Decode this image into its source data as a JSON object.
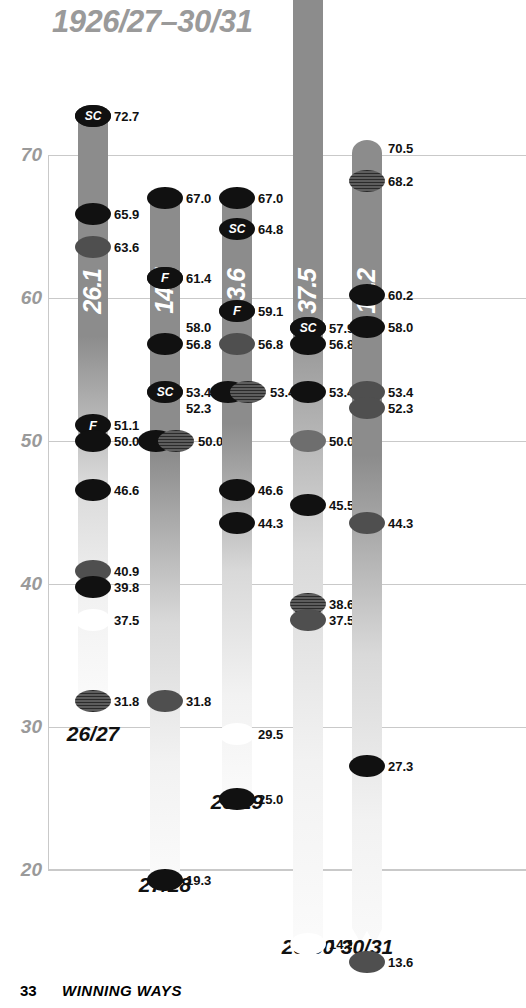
{
  "chart_data": {
    "type": "scatter",
    "title": "1926/27–30/31",
    "xlabel": "",
    "ylabel": "",
    "ylim": [
      20,
      90
    ],
    "grid": true,
    "yticks": [
      "70",
      "60",
      "50",
      "40",
      "30",
      "20"
    ],
    "legend_position": "none",
    "categories": [
      "26/27",
      "27/28",
      "28/29",
      "29/30",
      "30/31"
    ],
    "bar_values": [
      26.1,
      14.7,
      13.6,
      37.5,
      18.2
    ],
    "series": [
      {
        "name": "26/27",
        "bar_label": "26.1",
        "bar_top": 72.7,
        "bar_bottom": 31.8,
        "bar_break": false,
        "points": [
          {
            "value": "72.7",
            "badge": "SC",
            "style": "dark"
          },
          {
            "value": "65.9",
            "badge": "",
            "style": "dark"
          },
          {
            "value": "63.6",
            "badge": "",
            "style": "mid"
          },
          {
            "value": "51.1",
            "badge": "F",
            "style": "none"
          },
          {
            "value": "50.0",
            "badge": "",
            "style": "dark"
          },
          {
            "value": "46.6",
            "badge": "",
            "style": "dark"
          },
          {
            "value": "40.9",
            "badge": "",
            "style": "mid"
          },
          {
            "value": "39.8",
            "badge": "",
            "style": "dark"
          },
          {
            "value": "37.5",
            "badge": "",
            "style": "light"
          },
          {
            "value": "31.8",
            "badge": "",
            "style": "hatch"
          }
        ]
      },
      {
        "name": "27/28",
        "bar_label": "14.7",
        "bar_top": 67.0,
        "bar_bottom": 19.3,
        "bar_break": false,
        "points": [
          {
            "value": "67.0",
            "badge": "",
            "style": "dark"
          },
          {
            "value": "61.4",
            "badge": "F",
            "style": "dark"
          },
          {
            "value": "58.0",
            "badge": "",
            "style": "none"
          },
          {
            "value": "56.8",
            "badge": "",
            "style": "dark"
          },
          {
            "value": "53.4",
            "badge": "SC",
            "style": "mid"
          },
          {
            "value": "52.3",
            "badge": "",
            "style": "none"
          },
          {
            "value": "50.0",
            "badge": "",
            "style": "dark+hatch"
          },
          {
            "value": "31.8",
            "badge": "",
            "style": "mid"
          },
          {
            "value": "19.3",
            "badge": "",
            "style": "dark"
          }
        ]
      },
      {
        "name": "28/29",
        "bar_label": "13.6",
        "bar_top": 67.0,
        "bar_bottom": 25.0,
        "bar_break": false,
        "points": [
          {
            "value": "67.0",
            "badge": "",
            "style": "dark"
          },
          {
            "value": "64.8",
            "badge": "SC",
            "style": "none"
          },
          {
            "value": "59.1",
            "badge": "F",
            "style": "mid"
          },
          {
            "value": "56.8",
            "badge": "",
            "style": "mid"
          },
          {
            "value": "53.4",
            "badge": "",
            "style": "dark+hatch"
          },
          {
            "value": "46.6",
            "badge": "",
            "style": "dark"
          },
          {
            "value": "44.3",
            "badge": "",
            "style": "dark"
          },
          {
            "value": "29.5",
            "badge": "",
            "style": "light"
          },
          {
            "value": "25.0",
            "badge": "",
            "style": "dark"
          }
        ]
      },
      {
        "name": "29/30",
        "bar_label": "37.5",
        "bar_top": 87.5,
        "bar_bottom": 14.8,
        "bar_break": true,
        "points": [
          {
            "value": "87.5",
            "badge": "F",
            "style": "none"
          },
          {
            "value": "57.9",
            "badge": "SC",
            "style": "dark"
          },
          {
            "value": "56.8",
            "badge": "",
            "style": "dark"
          },
          {
            "value": "53.4",
            "badge": "",
            "style": "dark"
          },
          {
            "value": "50.0",
            "badge": "",
            "style": "gray"
          },
          {
            "value": "45.5",
            "badge": "",
            "style": "dark"
          },
          {
            "value": "38.6",
            "badge": "",
            "style": "hatch"
          },
          {
            "value": "37.5",
            "badge": "",
            "style": "mid"
          },
          {
            "value": "14.8",
            "badge": "",
            "style": "light"
          }
        ]
      },
      {
        "name": "30/31",
        "bar_label": "18.2",
        "bar_top": 70.5,
        "bar_bottom": 13.6,
        "bar_break": true,
        "points": [
          {
            "value": "70.5",
            "badge": "",
            "style": "none"
          },
          {
            "value": "68.2",
            "badge": "",
            "style": "hatch"
          },
          {
            "value": "60.2",
            "badge": "",
            "style": "dark"
          },
          {
            "value": "58.0",
            "badge": "",
            "style": "dark"
          },
          {
            "value": "53.4",
            "badge": "",
            "style": "mid"
          },
          {
            "value": "52.3",
            "badge": "",
            "style": "mid"
          },
          {
            "value": "44.3",
            "badge": "",
            "style": "mid"
          },
          {
            "value": "27.3",
            "badge": "",
            "style": "dark"
          },
          {
            "value": "13.6",
            "badge": "",
            "style": "mid"
          }
        ]
      }
    ]
  },
  "footer": {
    "page_number": "33",
    "title": "WINNING WAYS"
  }
}
